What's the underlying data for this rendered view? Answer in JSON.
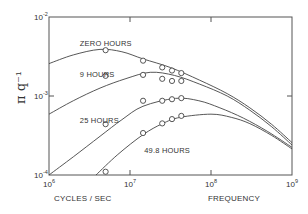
{
  "chart_data": {
    "type": "line",
    "title": "",
    "xlabel": "CYCLES / SEC",
    "xlabel_right": "FREQUENCY",
    "ylabel": "π q⁻¹",
    "xscale": "log",
    "yscale": "log",
    "xlim": [
      1000000,
      1000000000
    ],
    "ylim": [
      0.0001,
      0.01
    ],
    "grid": false,
    "legend": "inline labels",
    "x_ticks": [
      {
        "base": "10",
        "exp": "6",
        "value": 1000000
      },
      {
        "base": "10",
        "exp": "7",
        "value": 10000000
      },
      {
        "base": "10",
        "exp": "8",
        "value": 100000000
      },
      {
        "base": "10",
        "exp": "9",
        "value": 1000000000
      }
    ],
    "y_ticks": [
      {
        "base": "10",
        "exp": "-2",
        "value": 0.01
      },
      {
        "base": "10",
        "exp": "-3",
        "value": 0.001
      },
      {
        "base": "10",
        "exp": "-4",
        "value": 0.0001
      }
    ],
    "series": [
      {
        "name": "ZERO HOURS",
        "curve_log": [
          [
            6.0,
            -2.59
          ],
          [
            6.3,
            -2.48
          ],
          [
            6.63,
            -2.41
          ],
          [
            6.9,
            -2.44
          ],
          [
            7.16,
            -2.53
          ],
          [
            7.5,
            -2.64
          ],
          [
            7.86,
            -2.8
          ],
          [
            8.2,
            -2.97
          ],
          [
            8.48,
            -3.15
          ],
          [
            8.75,
            -3.36
          ],
          [
            9.0,
            -3.59
          ]
        ],
        "points": [
          [
            5000000,
            0.0038
          ],
          [
            14500000,
            0.0028
          ],
          [
            25000000,
            0.0023
          ],
          [
            33000000,
            0.0021
          ],
          [
            43000000,
            0.00195
          ]
        ]
      },
      {
        "name": "9 HOURS",
        "curve_log": [
          [
            6.0,
            -3.23
          ],
          [
            6.3,
            -3.06
          ],
          [
            6.63,
            -2.9
          ],
          [
            6.95,
            -2.78
          ],
          [
            7.25,
            -2.7
          ],
          [
            7.55,
            -2.74
          ],
          [
            7.86,
            -2.85
          ],
          [
            8.2,
            -3.0
          ],
          [
            8.48,
            -3.18
          ],
          [
            8.75,
            -3.39
          ],
          [
            9.0,
            -3.62
          ]
        ],
        "points": [
          [
            5000000,
            0.0018
          ],
          [
            14500000,
            0.00185
          ],
          [
            25000000,
            0.00165
          ],
          [
            33000000,
            0.00155
          ],
          [
            43000000,
            0.00155
          ]
        ]
      },
      {
        "name": "25 HOURS",
        "curve_log": [
          [
            6.0,
            -4.0
          ],
          [
            6.3,
            -3.77
          ],
          [
            6.63,
            -3.51
          ],
          [
            6.9,
            -3.3
          ],
          [
            7.16,
            -3.13
          ],
          [
            7.56,
            -3.03
          ],
          [
            7.85,
            -3.06
          ],
          [
            8.11,
            -3.15
          ],
          [
            8.4,
            -3.28
          ],
          [
            8.7,
            -3.45
          ],
          [
            9.0,
            -3.65
          ]
        ],
        "points": [
          [
            5000000,
            0.00044
          ],
          [
            14500000,
            0.00087
          ],
          [
            25000000,
            0.00087
          ],
          [
            33000000,
            0.00091
          ],
          [
            43000000,
            0.00094
          ]
        ]
      },
      {
        "name": "49.8 HOURS",
        "curve_log": [
          [
            6.58,
            -4.0
          ],
          [
            6.85,
            -3.74
          ],
          [
            7.16,
            -3.49
          ],
          [
            7.4,
            -3.35
          ],
          [
            7.62,
            -3.27
          ],
          [
            8.0,
            -3.23
          ],
          [
            8.25,
            -3.27
          ],
          [
            8.48,
            -3.35
          ],
          [
            8.75,
            -3.5
          ],
          [
            9.0,
            -3.67
          ]
        ],
        "points": [
          [
            5000000,
            0.00011
          ],
          [
            14500000,
            0.00034
          ],
          [
            25000000,
            0.00045
          ],
          [
            33000000,
            0.00051
          ],
          [
            43000000,
            0.00056
          ]
        ]
      }
    ],
    "series_labels": [
      {
        "text": "ZERO HOURS",
        "at": [
          2400000,
          0.0043
        ]
      },
      {
        "text": "9 HOURS",
        "at": [
          2400000,
          0.00175
        ]
      },
      {
        "text": "25 HOURS",
        "at": [
          2400000,
          0.00045
        ]
      },
      {
        "text": "49.8 HOURS",
        "at": [
          15000000,
          0.00019
        ]
      }
    ]
  }
}
